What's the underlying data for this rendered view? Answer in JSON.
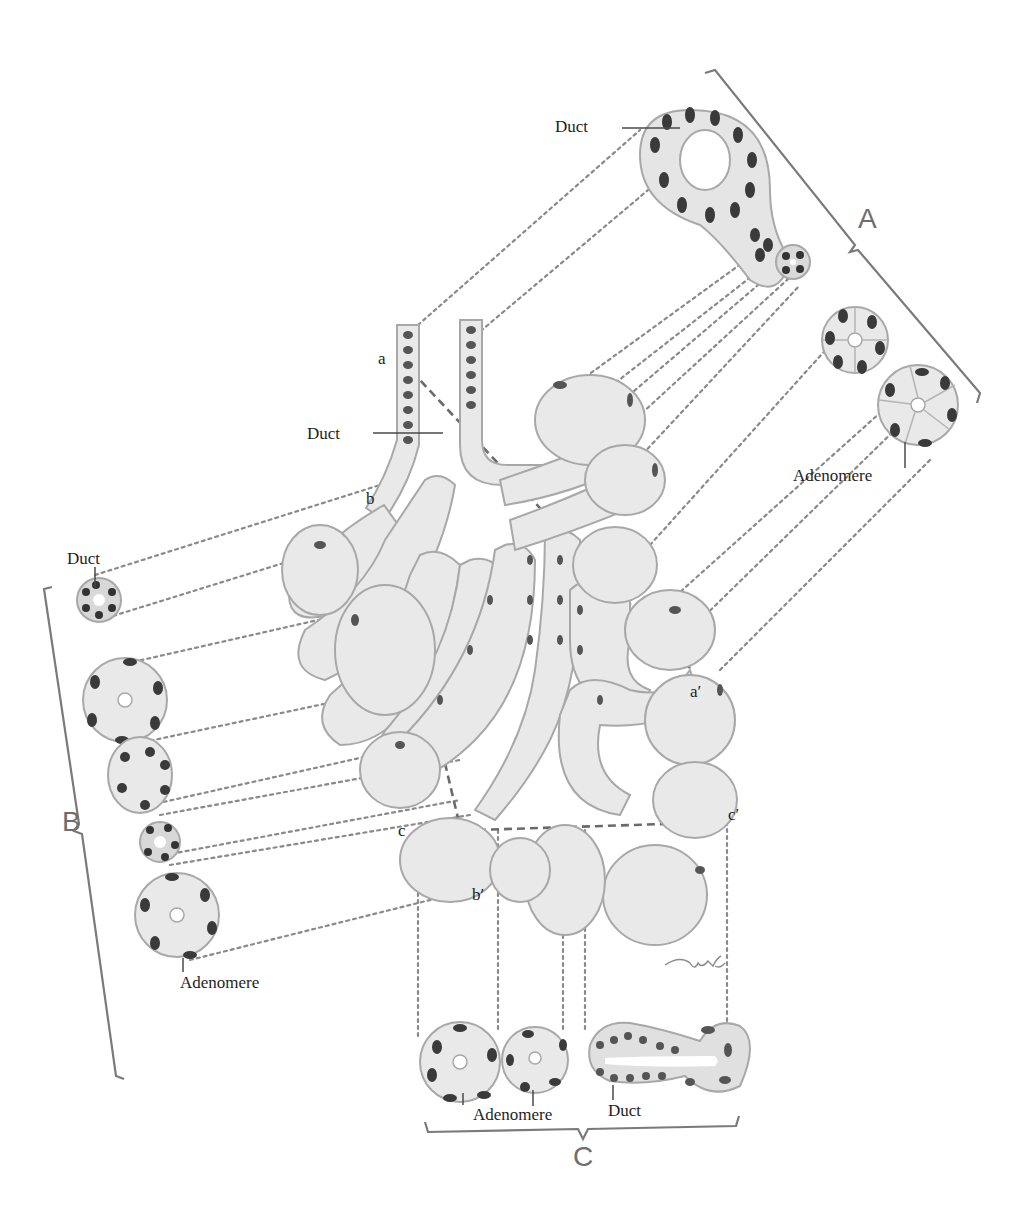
{
  "figure": {
    "type": "histology-illustration",
    "colors": {
      "background": "#ffffff",
      "cell_fill": "#e9e9e9",
      "cell_border": "#a8a8a8",
      "nucleus": "#3a3a3a",
      "dashed_line": "#8a8a8a",
      "bracket": "#7a7a7a",
      "text": "#1e1e1e"
    }
  },
  "labels": {
    "duct_top": "Duct",
    "duct_main": "Duct",
    "duct_left": "Duct",
    "adenomere_right": "Adenomere",
    "adenomere_left": "Adenomere",
    "adenomere_bottom": "Adenomere",
    "duct_bottom": "Duct"
  },
  "section_planes": {
    "A": "A",
    "B": "B",
    "C": "C"
  },
  "points": {
    "a": "a",
    "a_prime": "a′",
    "b": "b",
    "b_prime": "b′",
    "c": "c",
    "c_prime": "c′"
  },
  "signature": "M.L."
}
